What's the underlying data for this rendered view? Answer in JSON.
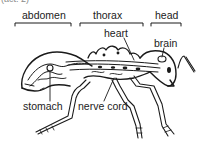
{
  "caption": "(act. 2)",
  "diagram": {
    "regions": [
      {
        "id": "abdomen",
        "label": "abdomen"
      },
      {
        "id": "thorax",
        "label": "thorax"
      },
      {
        "id": "head",
        "label": "head"
      }
    ],
    "organs": [
      {
        "id": "heart",
        "label": "heart"
      },
      {
        "id": "brain",
        "label": "brain"
      },
      {
        "id": "stomach",
        "label": "stomach"
      },
      {
        "id": "nerve-cord",
        "label": "nerve cord"
      }
    ],
    "colors": {
      "ink": "#1a1a1a",
      "background": "#ffffff"
    }
  }
}
